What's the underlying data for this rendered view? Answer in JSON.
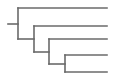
{
  "diagram": {
    "type": "dendrogram",
    "orientation": "left-to-right",
    "line_color": "#6a6a6a",
    "line_width": 1.6,
    "leaf_end_x": 107,
    "root": {
      "x0": 8,
      "x1": 18,
      "y": 24
    },
    "internal_nodes": [
      {
        "id": "n1",
        "x": 18,
        "y_top": 8,
        "y_bottom": 39
      },
      {
        "id": "n2",
        "x": 34,
        "y_top": 26,
        "y_bottom": 52
      },
      {
        "id": "n3",
        "x": 49,
        "y_top": 39,
        "y_bottom": 64
      },
      {
        "id": "n4",
        "x": 65,
        "y_top": 55,
        "y_bottom": 72
      }
    ],
    "connectors": [
      {
        "from": "n1",
        "to": "n2",
        "y": 39,
        "x0": 18,
        "x1": 34
      },
      {
        "from": "n2",
        "to": "n3",
        "y": 52,
        "x0": 34,
        "x1": 49
      },
      {
        "from": "n3",
        "to": "n4",
        "y": 64,
        "x0": 49,
        "x1": 65
      }
    ],
    "leaves": [
      {
        "id": "leaf-1",
        "parent": "n1",
        "y": 8,
        "x0": 18
      },
      {
        "id": "leaf-2",
        "parent": "n2",
        "y": 26,
        "x0": 34
      },
      {
        "id": "leaf-3",
        "parent": "n3",
        "y": 39,
        "x0": 49
      },
      {
        "id": "leaf-4",
        "parent": "n4",
        "y": 55,
        "x0": 65
      },
      {
        "id": "leaf-5",
        "parent": "n4",
        "y": 72,
        "x0": 65
      }
    ]
  }
}
